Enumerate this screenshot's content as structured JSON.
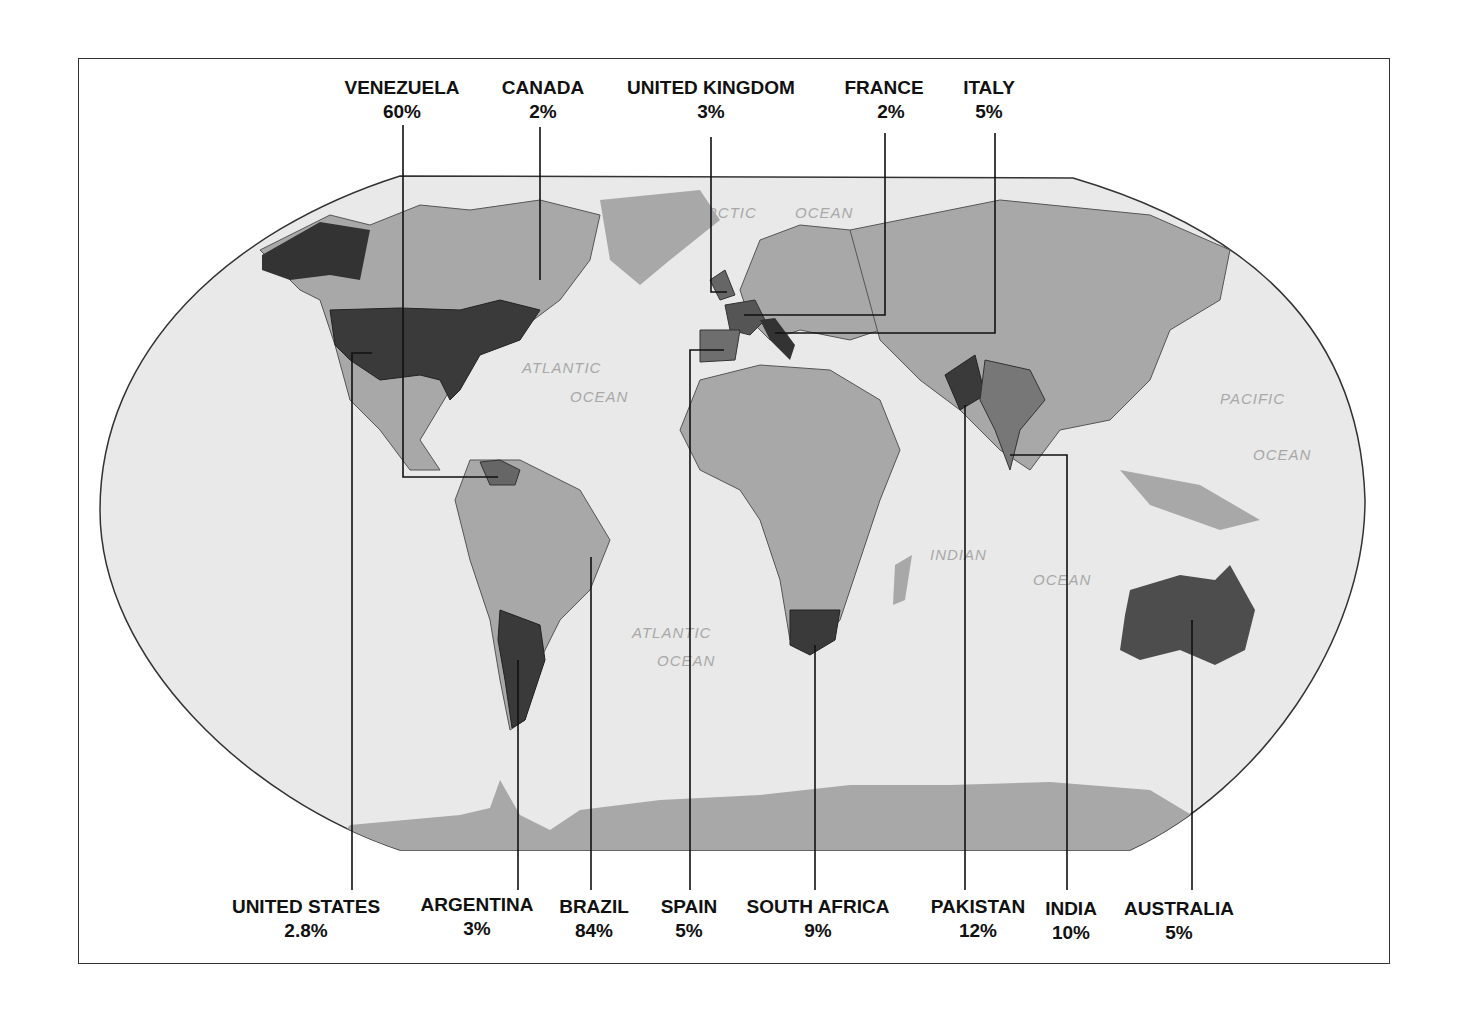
{
  "map": {
    "projection": "Robinson world map",
    "colors": {
      "ocean": "#e9e9e9",
      "land": "#a8a8a8",
      "highlight_dark": "#4a4a4a",
      "highlight_mid": "#6e6e6e",
      "frame": "#333333"
    },
    "ocean_labels": {
      "arctic_1": "ARCTIC",
      "arctic_2": "OCEAN",
      "atlantic_n_1": "ATLANTIC",
      "atlantic_n_2": "OCEAN",
      "atlantic_s_1": "ATLANTIC",
      "atlantic_s_2": "OCEAN",
      "indian_1": "INDIAN",
      "indian_2": "OCEAN",
      "pacific_1": "PACIFIC",
      "pacific_2": "OCEAN"
    }
  },
  "top_labels": [
    {
      "country": "VENEZUELA",
      "value": "60%"
    },
    {
      "country": "CANADA",
      "value": "2%"
    },
    {
      "country": "UNITED KINGDOM",
      "value": "3%"
    },
    {
      "country": "FRANCE",
      "value": "2%"
    },
    {
      "country": "ITALY",
      "value": "5%"
    }
  ],
  "bottom_labels": [
    {
      "country": "UNITED STATES",
      "value": "2.8%"
    },
    {
      "country": "ARGENTINA",
      "value": "3%"
    },
    {
      "country": "BRAZIL",
      "value": "84%"
    },
    {
      "country": "SPAIN",
      "value": "5%"
    },
    {
      "country": "SOUTH AFRICA",
      "value": "9%"
    },
    {
      "country": "PAKISTAN",
      "value": "12%"
    },
    {
      "country": "INDIA",
      "value": "10%"
    },
    {
      "country": "AUSTRALIA",
      "value": "5%"
    }
  ]
}
